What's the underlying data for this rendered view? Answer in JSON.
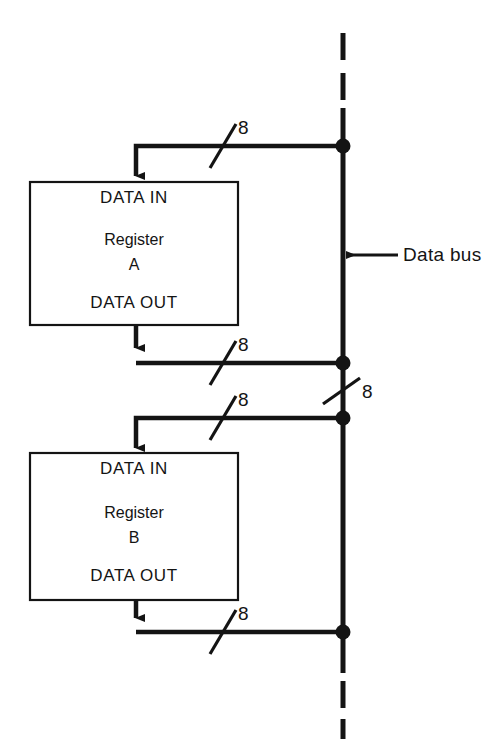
{
  "figure": {
    "kind": "block-diagram",
    "width": 504,
    "height": 739,
    "background": "#ffffff",
    "line_color": "#141414"
  },
  "bus": {
    "name": "data-bus",
    "label": "Data bus",
    "orientation": "vertical",
    "x": 343,
    "style": "solid center with dashed ends",
    "width_label": "8",
    "callout_arrow": "left"
  },
  "registers": [
    {
      "id": "register-a",
      "data_in_label": "DATA IN",
      "name_line1": "Register",
      "name_line2": "A",
      "data_out_label": "DATA OUT"
    },
    {
      "id": "register-b",
      "data_in_label": "DATA IN",
      "name_line1": "Register",
      "name_line2": "B",
      "data_out_label": "DATA OUT"
    }
  ],
  "connections": [
    {
      "id": "bus-to-a-in",
      "width": "8",
      "direction": "bus-to-register"
    },
    {
      "id": "a-out-to-bus",
      "width": "8",
      "direction": "register-to-bus"
    },
    {
      "id": "bus-to-b-in",
      "width": "8",
      "direction": "bus-to-register"
    },
    {
      "id": "b-out-to-bus",
      "width": "8",
      "direction": "register-to-bus"
    },
    {
      "id": "bus-segment",
      "width": "8",
      "direction": "along-bus"
    }
  ]
}
